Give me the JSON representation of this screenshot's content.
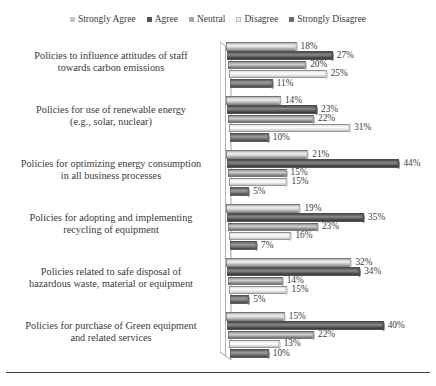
{
  "chart_data": {
    "type": "bar",
    "orientation": "horizontal",
    "title": "",
    "subtitle": "",
    "xlabel": "",
    "ylabel": "",
    "grid": false,
    "legend_position": "top",
    "value_suffix": "%",
    "xlim": [
      0,
      50
    ],
    "categories": [
      "Policies to influence attitudes of staff towards carbon emissions",
      "Policies for use of renewable energy (e.g., solar, nuclear)",
      "Policies for optimizing energy consumption in all business processes",
      "Policies for adopting and implementing recycling of equipment",
      "Policies related to safe disposal of hazardous waste, material or equipment",
      "Policies for purchase of Green equipment and related services"
    ],
    "category_lines": [
      [
        "Policies to influence attitudes of staff",
        "towards carbon emissions"
      ],
      [
        "Policies for use of renewable energy",
        "(e.g., solar, nuclear)"
      ],
      [
        "Policies for optimizing energy consumption",
        "in all business processes"
      ],
      [
        "Policies for adopting and implementing",
        "recycling of equipment"
      ],
      [
        "Policies related to safe disposal of",
        "hazardous waste, material or equipment"
      ],
      [
        "Policies for purchase of Green equipment",
        "and related services"
      ]
    ],
    "series": [
      {
        "name": "Strongly Agree",
        "color": "#c6c6c6",
        "values": [
          18,
          14,
          21,
          19,
          32,
          15
        ]
      },
      {
        "name": "Agree",
        "color": "#4f4f4f",
        "values": [
          27,
          23,
          44,
          35,
          34,
          40
        ]
      },
      {
        "name": "Neutral",
        "color": "#a5a5a5",
        "values": [
          20,
          22,
          15,
          23,
          14,
          22
        ]
      },
      {
        "name": "Disagree",
        "color": "#ececec",
        "values": [
          25,
          31,
          15,
          16,
          15,
          13
        ]
      },
      {
        "name": "Strongly Disagree",
        "color": "#6b6b6b",
        "values": [
          11,
          10,
          5,
          7,
          5,
          10
        ]
      }
    ],
    "value_labels": [
      [
        "18%",
        "27%",
        "20%",
        "25%",
        "11%"
      ],
      [
        "14%",
        "23%",
        "22%",
        "31%",
        "10%"
      ],
      [
        "21%",
        "44%",
        "15%",
        "15%",
        "5%"
      ],
      [
        "19%",
        "35%",
        "23%",
        "16%",
        "7%"
      ],
      [
        "32%",
        "34%",
        "14%",
        "15%",
        "5%"
      ],
      [
        "15%",
        "40%",
        "22%",
        "13%",
        "10%"
      ]
    ]
  },
  "legend": {
    "items": [
      {
        "label": "Strongly Agree",
        "color": "#c6c6c6"
      },
      {
        "label": "Agree",
        "color": "#4f4f4f"
      },
      {
        "label": "Neutral",
        "color": "#a5a5a5"
      },
      {
        "label": "Disagree",
        "color": "#ececec"
      },
      {
        "label": "Strongly Disagree",
        "color": "#6b6b6b"
      }
    ]
  }
}
